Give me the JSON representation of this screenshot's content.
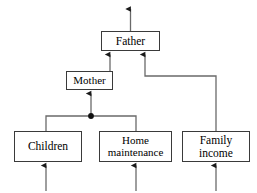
{
  "diagram": {
    "type": "causal-loop-hierarchy",
    "nodes": [
      {
        "id": "father",
        "label": "Father",
        "name": "node-father"
      },
      {
        "id": "mother",
        "label": "Mother",
        "name": "node-mother"
      },
      {
        "id": "children",
        "label": "Children",
        "name": "node-children"
      },
      {
        "id": "home",
        "label": "Home\nmaintenance",
        "name": "node-home-maintenance"
      },
      {
        "id": "income",
        "label": "Family\nincome",
        "name": "node-family-income"
      }
    ],
    "edges": [
      {
        "id": "e1",
        "from": "mother",
        "to": "father",
        "name": "edge-mother-to-father"
      },
      {
        "id": "e2",
        "from": "income",
        "to": "father",
        "name": "edge-family-income-to-father"
      },
      {
        "id": "e3",
        "from": "junction",
        "to": "mother",
        "name": "edge-junction-to-mother"
      },
      {
        "id": "e4",
        "from": "children",
        "to": "junction",
        "name": "edge-children-to-junction"
      },
      {
        "id": "e5",
        "from": "home",
        "to": "junction",
        "name": "edge-home-to-junction"
      },
      {
        "id": "e6",
        "from": "father",
        "to": "output",
        "name": "edge-father-output"
      },
      {
        "id": "e7",
        "from": "input",
        "to": "children",
        "name": "edge-input-to-children"
      },
      {
        "id": "e8",
        "from": "input",
        "to": "home",
        "name": "edge-input-to-home"
      },
      {
        "id": "e9",
        "from": "input",
        "to": "income",
        "name": "edge-input-to-family-income"
      }
    ],
    "junction": {
      "name": "junction-dot",
      "x": 91,
      "y": 116
    },
    "colors": {
      "background": "#ffffff",
      "box_border": "#3a3a3a",
      "line": "#5a5a5a",
      "arrow": "#1a1a1a",
      "text": "#000000"
    }
  }
}
